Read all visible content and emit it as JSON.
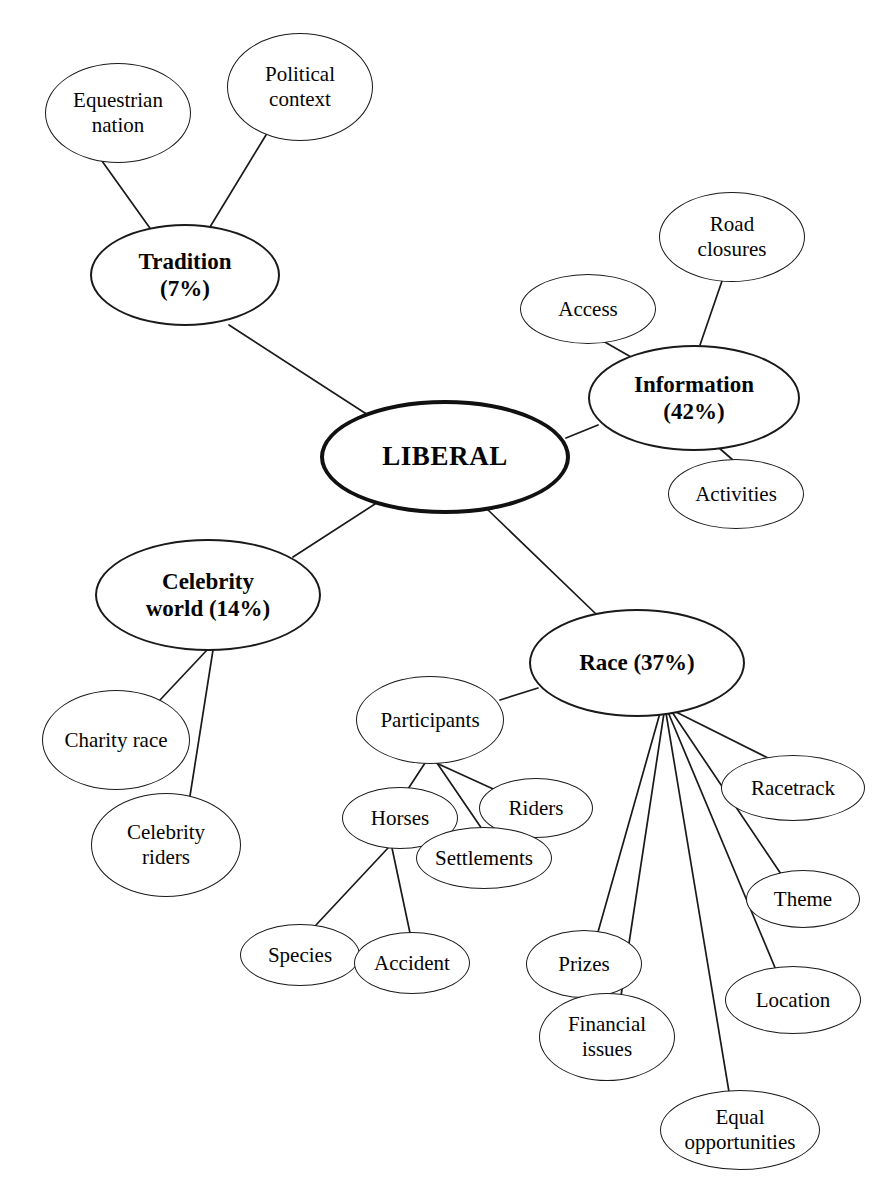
{
  "diagram": {
    "type": "mind-map",
    "title_node": "LIBERAL",
    "background_color": "#ffffff",
    "line_color": "#1a1a1a",
    "text_color": "#050505",
    "nodes": [
      {
        "id": "liberal",
        "label": "LIBERAL",
        "level": "central",
        "cx": 445,
        "cy": 457,
        "rx": 125,
        "ry": 57
      },
      {
        "id": "tradition",
        "label": "Tradition\n(7%)",
        "level": "branch",
        "cx": 185,
        "cy": 275,
        "rx": 95,
        "ry": 51
      },
      {
        "id": "information",
        "label": "Information\n(42%)",
        "level": "branch",
        "cx": 694,
        "cy": 398,
        "rx": 106,
        "ry": 53
      },
      {
        "id": "celebrity",
        "label": "Celebrity\nworld (14%)",
        "level": "branch",
        "cx": 208,
        "cy": 595,
        "rx": 113,
        "ry": 56
      },
      {
        "id": "race",
        "label": "Race (37%)",
        "level": "branch",
        "cx": 637,
        "cy": 663,
        "rx": 108,
        "ry": 54
      },
      {
        "id": "equestrian",
        "label": "Equestrian\nnation",
        "level": "leaf",
        "cx": 118,
        "cy": 113,
        "rx": 73,
        "ry": 50
      },
      {
        "id": "political",
        "label": "Political\ncontext",
        "level": "leaf",
        "cx": 300,
        "cy": 87,
        "rx": 73,
        "ry": 54
      },
      {
        "id": "access",
        "label": "Access",
        "level": "leaf",
        "cx": 588,
        "cy": 309,
        "rx": 68,
        "ry": 35
      },
      {
        "id": "roadclosures",
        "label": "Road\nclosures",
        "level": "leaf",
        "cx": 732,
        "cy": 237,
        "rx": 73,
        "ry": 45
      },
      {
        "id": "activities",
        "label": "Activities",
        "level": "leaf",
        "cx": 736,
        "cy": 494,
        "rx": 68,
        "ry": 35
      },
      {
        "id": "charityrace",
        "label": "Charity race",
        "level": "leaf",
        "cx": 116,
        "cy": 740,
        "rx": 74,
        "ry": 50
      },
      {
        "id": "celebrityriders",
        "label": "Celebrity\nriders",
        "level": "leaf",
        "cx": 166,
        "cy": 845,
        "rx": 75,
        "ry": 52
      },
      {
        "id": "participants",
        "label": "Participants",
        "level": "sub",
        "cx": 430,
        "cy": 720,
        "rx": 74,
        "ry": 44
      },
      {
        "id": "horses",
        "label": "Horses",
        "level": "sub",
        "cx": 400,
        "cy": 818,
        "rx": 58,
        "ry": 31
      },
      {
        "id": "riders",
        "label": "Riders",
        "level": "sub",
        "cx": 536,
        "cy": 808,
        "rx": 57,
        "ry": 30
      },
      {
        "id": "settlements",
        "label": "Settlements",
        "level": "sub",
        "cx": 484,
        "cy": 858,
        "rx": 68,
        "ry": 31
      },
      {
        "id": "species",
        "label": "Species",
        "level": "sub",
        "cx": 300,
        "cy": 955,
        "rx": 60,
        "ry": 31
      },
      {
        "id": "accident",
        "label": "Accident",
        "level": "sub",
        "cx": 412,
        "cy": 963,
        "rx": 58,
        "ry": 31
      },
      {
        "id": "prizes",
        "label": "Prizes",
        "level": "leaf",
        "cx": 584,
        "cy": 964,
        "rx": 58,
        "ry": 34
      },
      {
        "id": "financial",
        "label": "Financial\nissues",
        "level": "leaf",
        "cx": 607,
        "cy": 1037,
        "rx": 68,
        "ry": 44
      },
      {
        "id": "equal",
        "label": "Equal\nopportunities",
        "level": "leaf",
        "cx": 740,
        "cy": 1130,
        "rx": 80,
        "ry": 40
      },
      {
        "id": "location",
        "label": "Location",
        "level": "leaf",
        "cx": 793,
        "cy": 1000,
        "rx": 68,
        "ry": 34
      },
      {
        "id": "theme",
        "label": "Theme",
        "level": "leaf",
        "cx": 803,
        "cy": 899,
        "rx": 57,
        "ry": 29
      },
      {
        "id": "racetrack",
        "label": "Racetrack",
        "level": "leaf",
        "cx": 793,
        "cy": 788,
        "rx": 72,
        "ry": 33
      }
    ],
    "edges": [
      {
        "from": "liberal",
        "to": "tradition",
        "x1": 368,
        "y1": 415,
        "x2": 229,
        "y2": 325
      },
      {
        "from": "liberal",
        "to": "information",
        "x1": 566,
        "y1": 438,
        "x2": 598,
        "y2": 425
      },
      {
        "from": "liberal",
        "to": "celebrity",
        "x1": 375,
        "y1": 504,
        "x2": 293,
        "y2": 557
      },
      {
        "from": "liberal",
        "to": "race",
        "x1": 487,
        "y1": 509,
        "x2": 596,
        "y2": 614
      },
      {
        "from": "tradition",
        "to": "equestrian",
        "x1": 152,
        "y1": 231,
        "x2": 102,
        "y2": 161
      },
      {
        "from": "tradition",
        "to": "political",
        "x1": 210,
        "y1": 227,
        "x2": 266,
        "y2": 135
      },
      {
        "from": "information",
        "to": "access",
        "x1": 631,
        "y1": 357,
        "x2": 603,
        "y2": 341
      },
      {
        "from": "information",
        "to": "roadclosures",
        "x1": 700,
        "y1": 345,
        "x2": 722,
        "y2": 281
      },
      {
        "from": "information",
        "to": "activities",
        "x1": 718,
        "y1": 447,
        "x2": 734,
        "y2": 461
      },
      {
        "from": "celebrity",
        "to": "charityrace",
        "x1": 207,
        "y1": 650,
        "x2": 160,
        "y2": 700
      },
      {
        "from": "celebrity",
        "to": "celebrityriders",
        "x1": 213,
        "y1": 650,
        "x2": 190,
        "y2": 796
      },
      {
        "from": "race",
        "to": "participants",
        "x1": 538,
        "y1": 688,
        "x2": 500,
        "y2": 700
      },
      {
        "from": "participants",
        "to": "horses",
        "x1": 425,
        "y1": 763,
        "x2": 408,
        "y2": 789
      },
      {
        "from": "participants",
        "to": "riders",
        "x1": 434,
        "y1": 762,
        "x2": 502,
        "y2": 793
      },
      {
        "from": "participants",
        "to": "settlements",
        "x1": 437,
        "y1": 763,
        "x2": 482,
        "y2": 829
      },
      {
        "from": "horses",
        "to": "species",
        "x1": 388,
        "y1": 848,
        "x2": 316,
        "y2": 925
      },
      {
        "from": "horses",
        "to": "accident",
        "x1": 392,
        "y1": 848,
        "x2": 410,
        "y2": 933
      },
      {
        "from": "race",
        "to": "racetrack",
        "x1": 676,
        "y1": 712,
        "x2": 768,
        "y2": 758
      },
      {
        "from": "race",
        "to": "theme",
        "x1": 672,
        "y1": 712,
        "x2": 781,
        "y2": 874
      },
      {
        "from": "race",
        "to": "location",
        "x1": 668,
        "y1": 712,
        "x2": 776,
        "y2": 970
      },
      {
        "from": "race",
        "to": "prizes",
        "x1": 660,
        "y1": 713,
        "x2": 598,
        "y2": 932
      },
      {
        "from": "race",
        "to": "financial",
        "x1": 664,
        "y1": 713,
        "x2": 621,
        "y2": 996
      },
      {
        "from": "race",
        "to": "equal",
        "x1": 666,
        "y1": 713,
        "x2": 729,
        "y2": 1092
      }
    ]
  }
}
